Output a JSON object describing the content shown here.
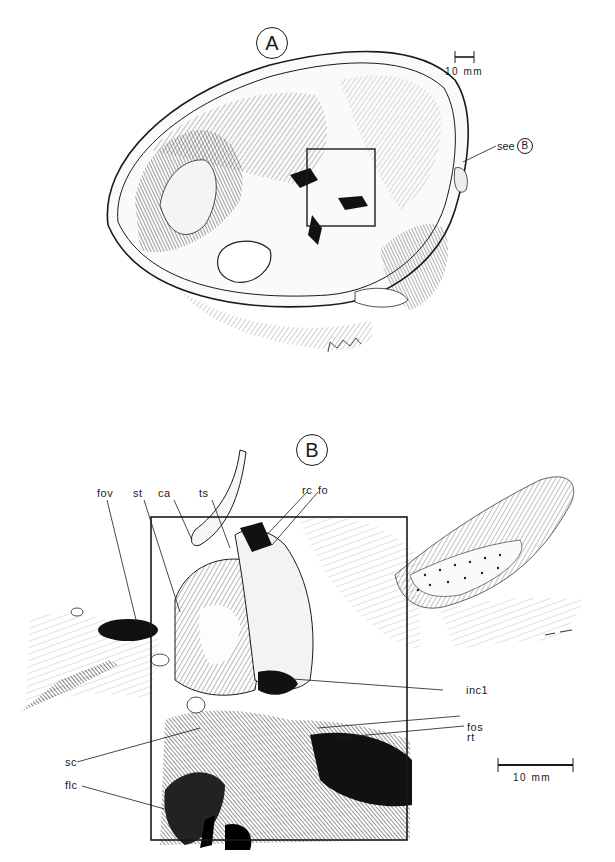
{
  "figure": {
    "panel_a": {
      "letter": "A",
      "scale_bar_label": "10 mm",
      "reference": {
        "prefix": "see",
        "target": "B"
      },
      "inset_box": "highlighted region (detail shown in B)"
    },
    "panel_b": {
      "letter": "B",
      "scale_bar_label": "10 mm",
      "labels": {
        "fov": "fov",
        "st": "st",
        "ca": "ca",
        "ts": "ts",
        "rc": "rc",
        "fo": "fo",
        "inc1": "inc1",
        "fos": "fos",
        "rt": "rt",
        "sc": "sc",
        "flc": "flc"
      }
    }
  },
  "colors": {
    "ink": "#1a1a1a",
    "paper": "#ffffff",
    "shade": "#555555"
  }
}
